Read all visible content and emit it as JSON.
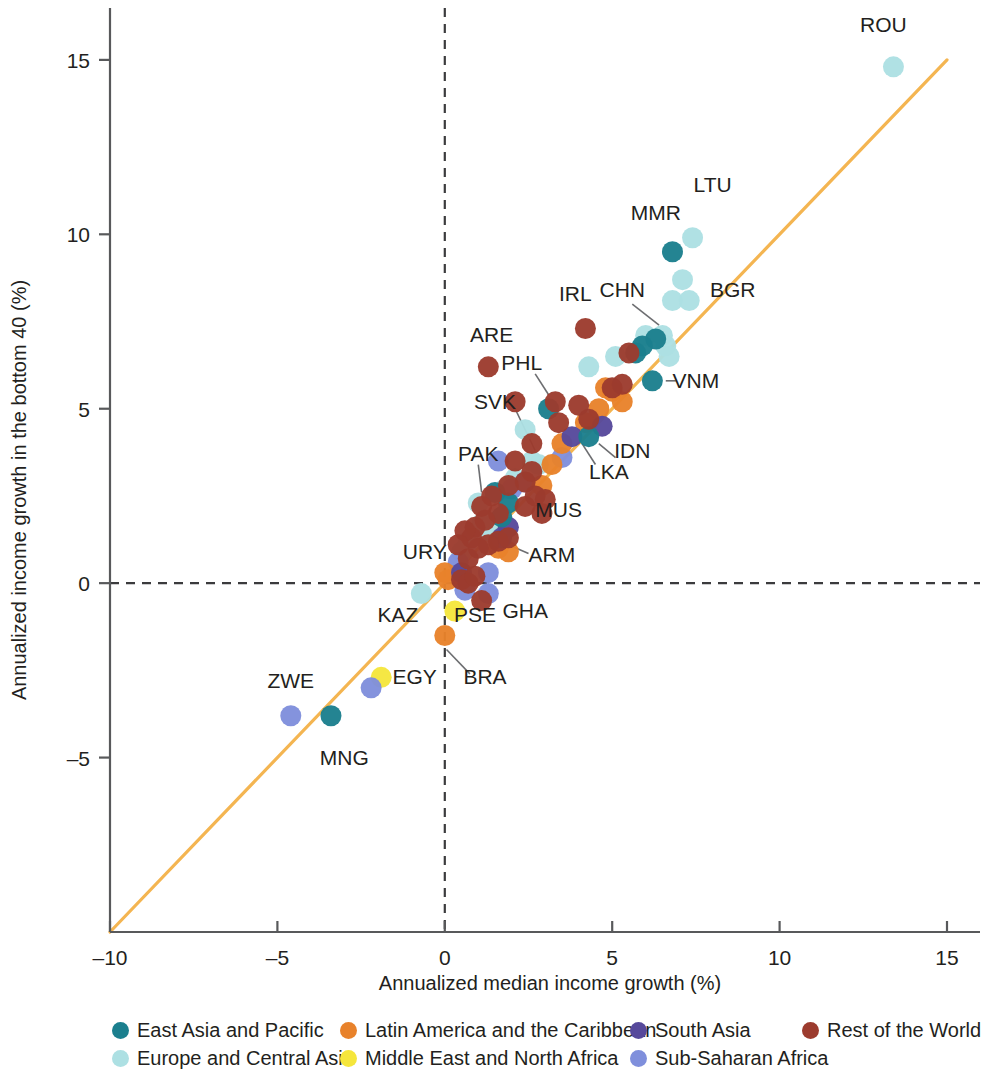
{
  "chart_data": {
    "type": "scatter",
    "title": "",
    "xlabel": "Annualized median income growth (%)",
    "ylabel": "Annualized income growth in the bottom 40 (%)",
    "xlim": [
      -10,
      15
    ],
    "ylim": [
      -10,
      16
    ],
    "xticks": [
      -10,
      -5,
      0,
      5,
      10,
      15
    ],
    "xtick_labels": [
      "–10",
      "–5",
      "0",
      "5",
      "10",
      "15"
    ],
    "yticks": [
      -5,
      0,
      5,
      10,
      15
    ],
    "ytick_labels": [
      "–5",
      "0",
      "5",
      "10",
      "15"
    ],
    "grid": false,
    "reference_line": {
      "label": "45-degree line (equal growth)",
      "color": "#f4b551",
      "from": [
        -10,
        -10
      ],
      "to": [
        15,
        15
      ]
    },
    "zero_lines": {
      "x": 0,
      "y": 0,
      "style": "dashed",
      "color": "#3b3b3d"
    },
    "legend_position": "bottom",
    "series": [
      {
        "name": "East Asia and Pacific",
        "color": "#1b7f8e",
        "points": [
          {
            "label": "MNG",
            "x": -3.4,
            "y": -3.8
          },
          {
            "label": "MMR",
            "x": 6.8,
            "y": 9.5
          },
          {
            "label": "VNM",
            "x": 6.2,
            "y": 5.8
          },
          {
            "label": "PHL",
            "x": 3.1,
            "y": 5.0
          },
          {
            "label": "IDN",
            "x": 4.3,
            "y": 4.2
          },
          {
            "label": "",
            "x": 6.3,
            "y": 7.0
          },
          {
            "label": "",
            "x": 5.9,
            "y": 6.8
          },
          {
            "label": "",
            "x": 5.7,
            "y": 6.6
          },
          {
            "label": "",
            "x": 1.9,
            "y": 2.3
          },
          {
            "label": "",
            "x": 1.7,
            "y": 1.9
          },
          {
            "label": "",
            "x": 1.5,
            "y": 2.6
          }
        ]
      },
      {
        "name": "Europe and Central Asia",
        "color": "#ade0e3",
        "points": [
          {
            "label": "ROU",
            "x": 13.4,
            "y": 14.8
          },
          {
            "label": "LTU",
            "x": 7.4,
            "y": 9.9
          },
          {
            "label": "BGR",
            "x": 7.1,
            "y": 8.7
          },
          {
            "label": "CHN",
            "x": 6.5,
            "y": 7.1
          },
          {
            "label": "",
            "x": 6.8,
            "y": 8.1
          },
          {
            "label": "",
            "x": 7.3,
            "y": 8.1
          },
          {
            "label": "",
            "x": 6.0,
            "y": 7.1
          },
          {
            "label": "",
            "x": 6.6,
            "y": 6.8
          },
          {
            "label": "",
            "x": 5.1,
            "y": 6.5
          },
          {
            "label": "",
            "x": 6.7,
            "y": 6.5
          },
          {
            "label": "",
            "x": 4.3,
            "y": 6.2
          },
          {
            "label": "SVK",
            "x": 2.8,
            "y": 3.4
          },
          {
            "label": "",
            "x": 2.4,
            "y": 4.4
          },
          {
            "label": "",
            "x": 2.6,
            "y": 3.5
          },
          {
            "label": "",
            "x": 2.1,
            "y": 3.0
          },
          {
            "label": "",
            "x": 1.8,
            "y": 2.7
          },
          {
            "label": "",
            "x": 1.0,
            "y": 2.3
          },
          {
            "label": "",
            "x": 1.1,
            "y": 1.7
          },
          {
            "label": "",
            "x": 1.3,
            "y": 1.5
          },
          {
            "label": "",
            "x": 0.7,
            "y": 1.2
          },
          {
            "label": "URY",
            "x": 0.5,
            "y": 0.9
          },
          {
            "label": "KAZ",
            "x": -0.7,
            "y": -0.3
          }
        ]
      },
      {
        "name": "Latin America and the Caribbean",
        "color": "#e8822b",
        "points": [
          {
            "label": "BRA",
            "x": 0.0,
            "y": -1.5
          },
          {
            "label": "",
            "x": 0.0,
            "y": 0.3
          },
          {
            "label": "",
            "x": 0.1,
            "y": 0.1
          },
          {
            "label": "",
            "x": 1.6,
            "y": 1.0
          },
          {
            "label": "",
            "x": 1.9,
            "y": 0.9
          },
          {
            "label": "",
            "x": 2.9,
            "y": 2.8
          },
          {
            "label": "",
            "x": 3.2,
            "y": 3.4
          },
          {
            "label": "",
            "x": 3.5,
            "y": 4.0
          },
          {
            "label": "",
            "x": 4.2,
            "y": 4.6
          },
          {
            "label": "",
            "x": 4.6,
            "y": 5.0
          },
          {
            "label": "",
            "x": 5.0,
            "y": 5.5
          },
          {
            "label": "",
            "x": 5.3,
            "y": 5.2
          },
          {
            "label": "",
            "x": 4.8,
            "y": 5.6
          }
        ]
      },
      {
        "name": "Middle East and North Africa",
        "color": "#f5e63c",
        "points": [
          {
            "label": "EGY",
            "x": -1.9,
            "y": -2.7
          },
          {
            "label": "PSE",
            "x": 0.3,
            "y": -0.8
          }
        ]
      },
      {
        "name": "South Asia",
        "color": "#56499b",
        "points": [
          {
            "label": "LKA",
            "x": 3.8,
            "y": 4.2
          },
          {
            "label": "",
            "x": 4.7,
            "y": 4.5
          },
          {
            "label": "",
            "x": 1.9,
            "y": 1.6
          },
          {
            "label": "PAK",
            "x": 1.7,
            "y": 1.3
          },
          {
            "label": "",
            "x": 0.5,
            "y": 0.3
          }
        ]
      },
      {
        "name": "Sub-Saharan Africa",
        "color": "#7f8fdc",
        "points": [
          {
            "label": "ZWE",
            "x": -4.6,
            "y": -3.8
          },
          {
            "label": "",
            "x": -2.2,
            "y": -3.0
          },
          {
            "label": "GHA",
            "x": 1.3,
            "y": -0.3
          },
          {
            "label": "",
            "x": 0.6,
            "y": -0.2
          },
          {
            "label": "",
            "x": 0.4,
            "y": 0.6
          },
          {
            "label": "",
            "x": 1.6,
            "y": 3.5
          },
          {
            "label": "",
            "x": 2.0,
            "y": 2.7
          },
          {
            "label": "",
            "x": 2.4,
            "y": 2.9
          },
          {
            "label": "",
            "x": 3.5,
            "y": 3.6
          },
          {
            "label": "",
            "x": 1.3,
            "y": 0.3
          }
        ]
      },
      {
        "name": "Rest of the World",
        "color": "#9c3b2e",
        "points": [
          {
            "label": "ARE",
            "x": 1.3,
            "y": 6.2
          },
          {
            "label": "IRL",
            "x": 4.2,
            "y": 7.3
          },
          {
            "label": "",
            "x": 3.3,
            "y": 5.2
          },
          {
            "label": "",
            "x": 2.1,
            "y": 5.2
          },
          {
            "label": "",
            "x": 3.4,
            "y": 4.6
          },
          {
            "label": "",
            "x": 2.6,
            "y": 4.0
          },
          {
            "label": "",
            "x": 4.0,
            "y": 5.1
          },
          {
            "label": "",
            "x": 4.3,
            "y": 4.7
          },
          {
            "label": "",
            "x": 5.0,
            "y": 5.6
          },
          {
            "label": "",
            "x": 5.3,
            "y": 5.7
          },
          {
            "label": "",
            "x": 5.5,
            "y": 6.6
          },
          {
            "label": "",
            "x": 2.1,
            "y": 3.5
          },
          {
            "label": "",
            "x": 2.4,
            "y": 2.9
          },
          {
            "label": "",
            "x": 2.6,
            "y": 3.2
          },
          {
            "label": "",
            "x": 2.7,
            "y": 2.5
          },
          {
            "label": "MUS",
            "x": 2.4,
            "y": 2.2
          },
          {
            "label": "",
            "x": 1.9,
            "y": 2.8
          },
          {
            "label": "",
            "x": 1.4,
            "y": 2.5
          },
          {
            "label": "",
            "x": 1.1,
            "y": 2.2
          },
          {
            "label": "",
            "x": 1.6,
            "y": 2.0
          },
          {
            "label": "",
            "x": 1.2,
            "y": 1.8
          },
          {
            "label": "",
            "x": 0.9,
            "y": 1.6
          },
          {
            "label": "",
            "x": 0.8,
            "y": 1.3
          },
          {
            "label": "ARM",
            "x": 1.6,
            "y": 1.2
          },
          {
            "label": "",
            "x": 1.9,
            "y": 1.3
          },
          {
            "label": "",
            "x": 1.3,
            "y": 1.1
          },
          {
            "label": "",
            "x": 1.0,
            "y": 1.0
          },
          {
            "label": "",
            "x": 0.7,
            "y": 0.7
          },
          {
            "label": "",
            "x": 0.6,
            "y": 1.5
          },
          {
            "label": "",
            "x": 0.4,
            "y": 1.1
          },
          {
            "label": "",
            "x": 0.5,
            "y": 0.1
          },
          {
            "label": "",
            "x": 0.7,
            "y": 0.0
          },
          {
            "label": "",
            "x": 0.9,
            "y": 0.2
          },
          {
            "label": "",
            "x": 1.1,
            "y": -0.5
          },
          {
            "label": "",
            "x": 2.9,
            "y": 2.0
          },
          {
            "label": "",
            "x": 3.0,
            "y": 2.4
          }
        ]
      }
    ],
    "annotations": [
      {
        "text": "ROU",
        "x": 13.1,
        "y": 16.0,
        "anchor": "middle",
        "leader": null
      },
      {
        "text": "LTU",
        "x": 8.0,
        "y": 11.4,
        "anchor": "middle",
        "leader": null
      },
      {
        "text": "MMR",
        "x": 6.3,
        "y": 10.6,
        "anchor": "middle",
        "leader": null
      },
      {
        "text": "BGR",
        "x": 8.6,
        "y": 8.4,
        "anchor": "middle",
        "leader": null
      },
      {
        "text": "CHN",
        "x": 5.3,
        "y": 8.4,
        "anchor": "middle",
        "leader": [
          [
            5.6,
            8.0
          ],
          [
            6.4,
            7.4
          ]
        ]
      },
      {
        "text": "IRL",
        "x": 3.9,
        "y": 8.3,
        "anchor": "middle",
        "leader": null
      },
      {
        "text": "ARE",
        "x": 1.4,
        "y": 7.1,
        "anchor": "middle",
        "leader": null
      },
      {
        "text": "PHL",
        "x": 2.3,
        "y": 6.3,
        "anchor": "middle",
        "leader": [
          [
            2.7,
            6.0
          ],
          [
            3.1,
            5.4
          ]
        ]
      },
      {
        "text": "VNM",
        "x": 7.5,
        "y": 5.8,
        "anchor": "middle",
        "leader": [
          [
            6.6,
            5.8
          ],
          [
            6.9,
            5.8
          ]
        ]
      },
      {
        "text": "SVK",
        "x": 1.5,
        "y": 5.2,
        "anchor": "middle",
        "leader": [
          [
            2.1,
            5.0
          ],
          [
            2.7,
            3.8
          ]
        ]
      },
      {
        "text": "IDN",
        "x": 5.6,
        "y": 3.8,
        "anchor": "middle",
        "leader": [
          [
            4.6,
            4.0
          ],
          [
            5.1,
            3.6
          ]
        ]
      },
      {
        "text": "LKA",
        "x": 4.9,
        "y": 3.2,
        "anchor": "middle",
        "leader": [
          [
            4.1,
            4.0
          ],
          [
            4.5,
            3.4
          ]
        ]
      },
      {
        "text": "PAK",
        "x": 1.0,
        "y": 3.7,
        "anchor": "middle",
        "leader": [
          [
            1.0,
            3.4
          ],
          [
            1.1,
            2.6
          ]
        ]
      },
      {
        "text": "MUS",
        "x": 3.4,
        "y": 2.1,
        "anchor": "middle",
        "leader": null
      },
      {
        "text": "ARM",
        "x": 3.2,
        "y": 0.8,
        "anchor": "middle",
        "leader": [
          [
            2.5,
            0.85
          ],
          [
            1.9,
            1.1
          ]
        ]
      },
      {
        "text": "URY",
        "x": -0.6,
        "y": 0.9,
        "anchor": "middle",
        "leader": null
      },
      {
        "text": "GHA",
        "x": 2.4,
        "y": -0.8,
        "anchor": "middle",
        "leader": null
      },
      {
        "text": "PSE",
        "x": 0.9,
        "y": -0.9,
        "anchor": "middle",
        "leader": null
      },
      {
        "text": "KAZ",
        "x": -1.4,
        "y": -0.9,
        "anchor": "middle",
        "leader": null
      },
      {
        "text": "BRA",
        "x": 1.2,
        "y": -2.7,
        "anchor": "middle",
        "leader": [
          [
            0.75,
            -2.6
          ],
          [
            0.05,
            -1.9
          ]
        ]
      },
      {
        "text": "EGY",
        "x": -0.9,
        "y": -2.7,
        "anchor": "middle",
        "leader": null
      },
      {
        "text": "ZWE",
        "x": -4.6,
        "y": -2.8,
        "anchor": "middle",
        "leader": null
      },
      {
        "text": "MNG",
        "x": -3.0,
        "y": -5.0,
        "anchor": "middle",
        "leader": null
      }
    ]
  },
  "legend": {
    "items": [
      {
        "label": "East Asia and Pacific",
        "color": "#1b7f8e"
      },
      {
        "label": "Latin America and the Caribbean",
        "color": "#e8822b"
      },
      {
        "label": "South Asia",
        "color": "#56499b"
      },
      {
        "label": "Rest of the World",
        "color": "#9c3b2e"
      },
      {
        "label": "Europe and Central Asia",
        "color": "#ade0e3"
      },
      {
        "label": "Middle East and North Africa",
        "color": "#f5e63c"
      },
      {
        "label": "Sub-Saharan Africa",
        "color": "#7f8fdc"
      }
    ]
  }
}
